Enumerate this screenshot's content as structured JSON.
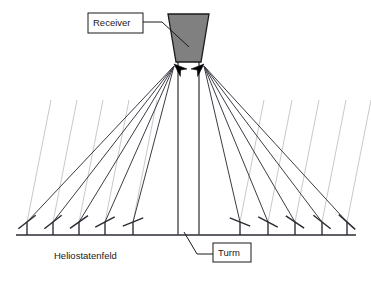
{
  "figure": {
    "background_color": "#ffffff",
    "width": 371,
    "height": 282
  },
  "colors": {
    "receiver_fill": "#808080",
    "outline": "#1a1a1a",
    "beam_line": "#3c3c46",
    "sun_ray": "#c9c9c9",
    "ground": "#2b2b33",
    "post": "#4a4a52",
    "arrow": "#000000",
    "label_box_fill": "#ffffff"
  },
  "labels": {
    "receiver": {
      "text": "Receiver",
      "boxed": true,
      "box": {
        "x": 88,
        "y": 13,
        "w": 55,
        "h": 20
      },
      "leader": "M143,22 L162,22 L189,47"
    },
    "tower": {
      "text": "Turm",
      "boxed": true,
      "box": {
        "x": 213,
        "y": 243,
        "w": 38,
        "h": 19
      },
      "leader": "M213,254 L197,254 L184,232"
    },
    "heliostat_field": {
      "text": "Heliostatenfeld",
      "boxed": false,
      "x": 54,
      "y": 256
    }
  },
  "receiver": {
    "name": "receiver",
    "shape": "trapezoid",
    "top_left_x": 168,
    "top_right_x": 209,
    "bottom_left_x": 176,
    "bottom_right_x": 201,
    "top_y": 14,
    "bottom_y": 62
  },
  "tower": {
    "name": "tower",
    "left_x": 178,
    "right_x": 199,
    "top_y": 62,
    "base_y": 235
  },
  "ground": {
    "y": 235,
    "x_start": 16,
    "x_end": 356
  },
  "focus_points": {
    "left": {
      "x": 174,
      "y": 64
    },
    "right": {
      "x": 204,
      "y": 64
    }
  },
  "arrowheads": [
    {
      "side": "left",
      "x": 174,
      "y": 64,
      "angle": 42
    },
    {
      "side": "right",
      "x": 204,
      "y": 64,
      "angle": 138
    }
  ],
  "heliostats": [
    {
      "id": "L1",
      "side": "left",
      "post_x": 27,
      "post_top_y": 222,
      "mirror_angle_deg": -38
    },
    {
      "id": "L2",
      "side": "left",
      "post_x": 53,
      "post_top_y": 222,
      "mirror_angle_deg": -38
    },
    {
      "id": "L3",
      "side": "left",
      "post_x": 79,
      "post_top_y": 222,
      "mirror_angle_deg": -35
    },
    {
      "id": "L4",
      "side": "left",
      "post_x": 105,
      "post_top_y": 222,
      "mirror_angle_deg": -28
    },
    {
      "id": "L5",
      "side": "left",
      "post_x": 133,
      "post_top_y": 222,
      "mirror_angle_deg": -22
    },
    {
      "id": "R1",
      "side": "right",
      "post_x": 240,
      "post_top_y": 222,
      "mirror_angle_deg": 22
    },
    {
      "id": "R2",
      "side": "right",
      "post_x": 268,
      "post_top_y": 222,
      "mirror_angle_deg": 28
    },
    {
      "id": "R3",
      "side": "right",
      "post_x": 295,
      "post_top_y": 222,
      "mirror_angle_deg": 34
    },
    {
      "id": "R4",
      "side": "right",
      "post_x": 322,
      "post_top_y": 222,
      "mirror_angle_deg": 38
    },
    {
      "id": "R5",
      "side": "right",
      "post_x": 347,
      "post_top_y": 222,
      "mirror_angle_deg": 42
    }
  ],
  "beams": [
    {
      "id": "B-L1",
      "from_x": 27,
      "from_y": 222,
      "to_x": 174,
      "to_y": 66
    },
    {
      "id": "B-L2",
      "from_x": 53,
      "from_y": 222,
      "to_x": 174,
      "to_y": 66
    },
    {
      "id": "B-L3",
      "from_x": 79,
      "from_y": 222,
      "to_x": 174,
      "to_y": 66
    },
    {
      "id": "B-L4",
      "from_x": 105,
      "from_y": 222,
      "to_x": 174,
      "to_y": 66
    },
    {
      "id": "B-L5",
      "from_x": 133,
      "from_y": 222,
      "to_x": 174,
      "to_y": 66
    },
    {
      "id": "B-R1",
      "from_x": 240,
      "from_y": 222,
      "to_x": 204,
      "to_y": 66
    },
    {
      "id": "B-R2",
      "from_x": 268,
      "from_y": 222,
      "to_x": 204,
      "to_y": 66
    },
    {
      "id": "B-R3",
      "from_x": 295,
      "from_y": 222,
      "to_x": 204,
      "to_y": 66
    },
    {
      "id": "B-R4",
      "from_x": 322,
      "from_y": 222,
      "to_x": 204,
      "to_y": 66
    },
    {
      "id": "B-R5",
      "from_x": 347,
      "from_y": 222,
      "to_x": 204,
      "to_y": 66
    }
  ],
  "sun_rays": [
    {
      "id": "S1",
      "bottom_x": 27,
      "bottom_y": 222,
      "top_x": 51,
      "top_y": 100
    },
    {
      "id": "S2",
      "bottom_x": 53,
      "bottom_y": 222,
      "top_x": 77,
      "top_y": 100
    },
    {
      "id": "S3",
      "bottom_x": 79,
      "bottom_y": 222,
      "top_x": 103,
      "top_y": 100
    },
    {
      "id": "S4",
      "bottom_x": 105,
      "bottom_y": 222,
      "top_x": 129,
      "top_y": 100
    },
    {
      "id": "S5",
      "bottom_x": 133,
      "bottom_y": 222,
      "top_x": 157,
      "top_y": 100
    },
    {
      "id": "S6",
      "bottom_x": 240,
      "bottom_y": 222,
      "top_x": 264,
      "top_y": 100
    },
    {
      "id": "S7",
      "bottom_x": 268,
      "bottom_y": 222,
      "top_x": 292,
      "top_y": 100
    },
    {
      "id": "S8",
      "bottom_x": 295,
      "bottom_y": 222,
      "top_x": 319,
      "top_y": 100
    },
    {
      "id": "S9",
      "bottom_x": 322,
      "bottom_y": 222,
      "top_x": 346,
      "top_y": 100
    },
    {
      "id": "S10",
      "bottom_x": 347,
      "bottom_y": 222,
      "top_x": 371,
      "top_y": 100
    }
  ]
}
